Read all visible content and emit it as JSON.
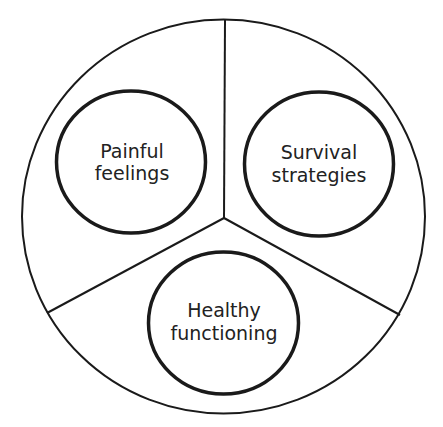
{
  "diagram": {
    "type": "segmented-circle",
    "outer": {
      "cx": 223.5,
      "cy": 216.5,
      "rx": 201.5,
      "ry": 197
    },
    "center": {
      "x": 224,
      "y": 218
    },
    "spokes": [
      {
        "x2": 225,
        "y2": 20
      },
      {
        "x2": 47,
        "y2": 313
      },
      {
        "x2": 400,
        "y2": 315
      }
    ],
    "stroke_color": "#1a1a1a",
    "segments": [
      {
        "id": "painful-feelings",
        "line1": "Painful",
        "line2": "feelings",
        "cx": 131,
        "cy": 162,
        "rx": 75,
        "ry": 71
      },
      {
        "id": "survival-strategies",
        "line1": "Survival",
        "line2": "strategies",
        "cx": 319,
        "cy": 164,
        "rx": 75,
        "ry": 72
      },
      {
        "id": "healthy-functioning",
        "line1": "Healthy",
        "line2": "functioning",
        "cx": 223,
        "cy": 323,
        "rx": 75,
        "ry": 71
      }
    ]
  }
}
